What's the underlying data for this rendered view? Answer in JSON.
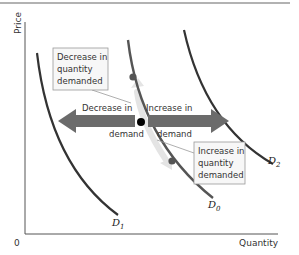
{
  "diagram": {
    "type": "supply-demand-shift",
    "axes": {
      "y_label": "Price",
      "x_label": "Quantity",
      "origin_label": "0"
    },
    "curves": [
      {
        "id": "D1",
        "label_main": "D",
        "label_sub": "1"
      },
      {
        "id": "D0",
        "label_main": "D",
        "label_sub": "0"
      },
      {
        "id": "D2",
        "label_main": "D",
        "label_sub": "2"
      }
    ],
    "shift_arrows": {
      "left": {
        "line1": "Decrease in",
        "line2": "demand"
      },
      "right": {
        "line1": "Increase in",
        "line2": "demand"
      }
    },
    "callouts": {
      "decrease_qd": {
        "lines": [
          "Decrease in",
          "quantity",
          "demanded"
        ]
      },
      "increase_qd": {
        "lines": [
          "Increase in",
          "quantity",
          "demanded"
        ]
      }
    },
    "colors": {
      "curve": "#333333",
      "d0_curve": "#555555",
      "shift_arrow": "#6b6b6b",
      "movement_arrow": "#e6e6e6",
      "point_on_curve": "#555555",
      "equilibrium_point": "#000000",
      "callout_border": "#9a9a9a",
      "callout_bg": "#f7f7f7",
      "axis": "#555555"
    }
  }
}
